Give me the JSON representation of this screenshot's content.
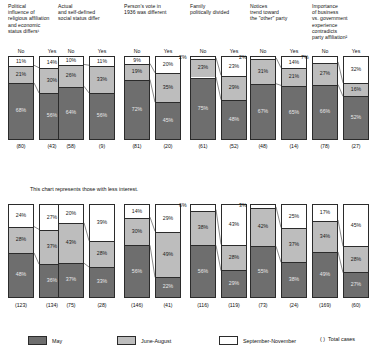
{
  "chart_data": {
    "type": "bar",
    "title": "",
    "note": "This chart represents those with less interest.",
    "subgroup_labels": [
      "No",
      "Yes"
    ],
    "series": [
      {
        "name": "May",
        "color": "#6e6e6e"
      },
      {
        "name": "June-August",
        "color": "#bdbdbd"
      },
      {
        "name": "September-November",
        "color": "#ffffff"
      }
    ],
    "legend": {
      "position": "bottom",
      "items": [
        {
          "label": "May",
          "swatch": "may"
        },
        {
          "label": "June-August",
          "swatch": "june-august"
        },
        {
          "label": "September-November",
          "swatch": "september-november"
        },
        {
          "label": "Total cases",
          "swatch": "paren"
        }
      ],
      "paren_symbol": "( )"
    },
    "ylim": [
      0,
      100
    ],
    "ylabel": "",
    "xlabel": "",
    "grid": false,
    "panels": [
      {
        "id": "upper",
        "groups": [
          {
            "question": "Political\ninfluence of\nreligious affiliation\nand economic\nstatus differs¹",
            "bars": [
              {
                "label": "No",
                "total": "(80)",
                "september_november": 11,
                "june_august": 21,
                "may": 68
              },
              {
                "label": "Yes",
                "total": "(43)",
                "september_november": 14,
                "june_august": 30,
                "may": 56
              }
            ]
          },
          {
            "question": "Actual\nand self-defined\nsocial status differ",
            "bars": [
              {
                "label": "No",
                "total": "(58)",
                "september_november": 10,
                "june_august": 26,
                "may": 64
              },
              {
                "label": "Yes",
                "total": "(9)",
                "september_november": 11,
                "june_august": 33,
                "may": 56
              }
            ]
          },
          {
            "question": "Person's vote in\n1936 was different",
            "bars": [
              {
                "label": "No",
                "total": "(81)",
                "september_november": 9,
                "june_august": 19,
                "may": 72
              },
              {
                "label": "Yes",
                "total": "(20)",
                "september_november": 20,
                "june_august": 35,
                "may": 45
              }
            ]
          },
          {
            "question": "Family\npolitically divided",
            "bars": [
              {
                "label": "No",
                "total": "(61)",
                "september_november": 2,
                "june_august": 23,
                "may": 75
              },
              {
                "label": "Yes",
                "total": "(52)",
                "september_november": 23,
                "june_august": 29,
                "may": 48
              }
            ]
          },
          {
            "question": "Notices\ntrend toward\nthe \"other\" party",
            "bars": [
              {
                "label": "No",
                "total": "(48)",
                "september_november": 2,
                "june_august": 31,
                "may": 67
              },
              {
                "label": "Yes",
                "total": "(14)",
                "september_november": 14,
                "june_august": 21,
                "may": 65
              }
            ]
          },
          {
            "question": "Importance\nof business\nvs. government\nexperience\ncontradicts\nparty affiliation²",
            "bars": [
              {
                "label": "No",
                "total": "(78)",
                "september_november": 7,
                "june_august": 27,
                "may": 66
              },
              {
                "label": "Yes",
                "total": "(27)",
                "september_november": 32,
                "june_august": 16,
                "may": 52
              }
            ]
          }
        ]
      },
      {
        "id": "lower",
        "groups": [
          {
            "question": "",
            "bars": [
              {
                "label": "No",
                "total": "(123)",
                "september_november": 24,
                "june_august": 28,
                "may": 48
              },
              {
                "label": "Yes",
                "total": "(134)",
                "september_november": 27,
                "june_august": 37,
                "may": 36
              }
            ]
          },
          {
            "question": "",
            "bars": [
              {
                "label": "No",
                "total": "(75)",
                "september_november": 20,
                "june_august": 43,
                "may": 37
              },
              {
                "label": "Yes",
                "total": "(28)",
                "september_november": 39,
                "june_august": 28,
                "may": 33
              }
            ]
          },
          {
            "question": "",
            "bars": [
              {
                "label": "No",
                "total": "(146)",
                "september_november": 14,
                "june_august": 30,
                "may": 56
              },
              {
                "label": "Yes",
                "total": "(41)",
                "september_november": 29,
                "june_august": 49,
                "may": 22
              }
            ]
          },
          {
            "question": "",
            "bars": [
              {
                "label": "No",
                "total": "(116)",
                "september_november": 6,
                "june_august": 38,
                "may": 56
              },
              {
                "label": "Yes",
                "total": "(119)",
                "september_november": 43,
                "june_august": 28,
                "may": 29
              }
            ]
          },
          {
            "question": "",
            "bars": [
              {
                "label": "No",
                "total": "(73)",
                "september_november": 3,
                "june_august": 42,
                "may": 55
              },
              {
                "label": "Yes",
                "total": "(24)",
                "september_november": 25,
                "june_august": 37,
                "may": 38
              }
            ]
          },
          {
            "question": "",
            "bars": [
              {
                "label": "No",
                "total": "(169)",
                "september_november": 17,
                "june_august": 34,
                "may": 49
              },
              {
                "label": "Yes",
                "total": "(60)",
                "september_november": 45,
                "june_august": 28,
                "may": 27
              }
            ]
          }
        ]
      }
    ]
  }
}
